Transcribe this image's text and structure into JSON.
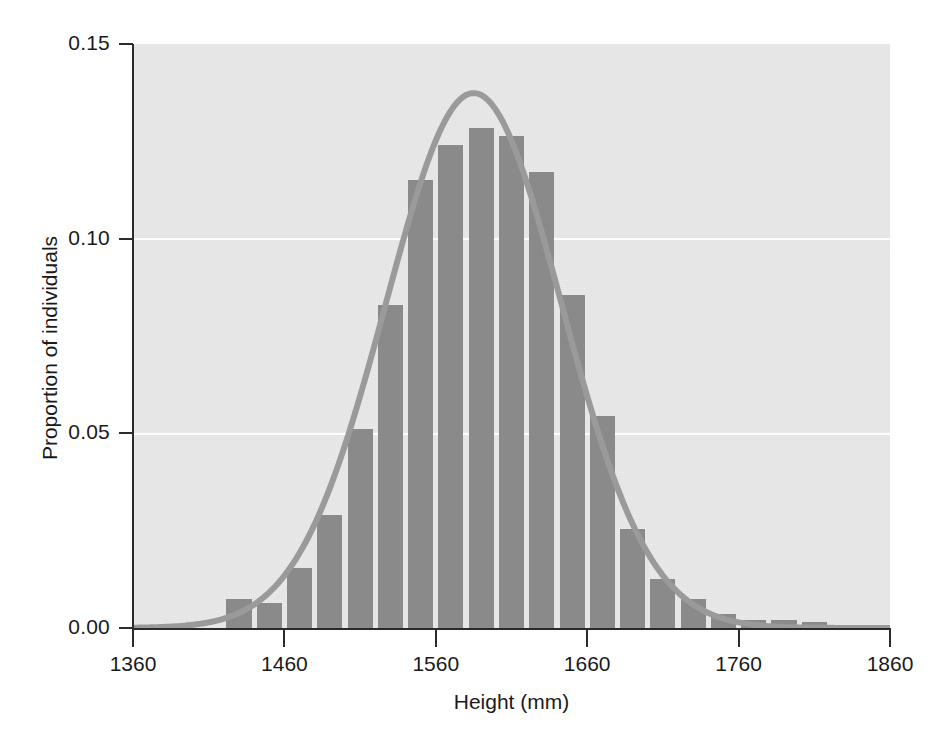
{
  "figure": {
    "background_color": "#ffffff",
    "plot_background_color": "#e9e9e9",
    "bar_color": "#8a8a8a",
    "curve_color": "#9a9a9a",
    "axis_color": "#2b2b2b",
    "gridline_color": "#ffffff"
  },
  "chart_data": {
    "type": "bar",
    "title": "",
    "subtitle": "",
    "xlabel": "Height (mm)",
    "ylabel": "Proportion of individuals",
    "xlim": [
      1360,
      1860
    ],
    "ylim": [
      0.0,
      0.15
    ],
    "xticks": [
      1360,
      1460,
      1560,
      1660,
      1760,
      1860
    ],
    "xticklabels": [
      "1360",
      "1460",
      "1560",
      "1660",
      "1760",
      "1860"
    ],
    "yticks": [
      0.0,
      0.05,
      0.1,
      0.15
    ],
    "yticklabels": [
      "0.00",
      "0.05",
      "0.10",
      "0.15"
    ],
    "grid": "horizontal-white-at-0.05-0.10",
    "legend": "none",
    "bin_width": 20,
    "bin_centers": [
      1430,
      1450,
      1470,
      1490,
      1510,
      1530,
      1550,
      1570,
      1590,
      1610,
      1630,
      1650,
      1670,
      1690,
      1710,
      1730,
      1750,
      1770,
      1790,
      1810
    ],
    "categories": [
      "1420-1440",
      "1440-1460",
      "1460-1480",
      "1480-1500",
      "1500-1520",
      "1520-1540",
      "1540-1560",
      "1560-1580",
      "1580-1600",
      "1600-1620",
      "1620-1640",
      "1640-1660",
      "1660-1680",
      "1680-1700",
      "1700-1720",
      "1720-1740",
      "1740-1760",
      "1760-1780",
      "1780-1800",
      "1800-1820"
    ],
    "values": [
      0.0075,
      0.0065,
      0.0155,
      0.029,
      0.051,
      0.083,
      0.115,
      0.124,
      0.1285,
      0.1265,
      0.117,
      0.0855,
      0.0545,
      0.0255,
      0.0125,
      0.0075,
      0.0035,
      0.002,
      0.002,
      0.0015
    ],
    "overlay_curve": {
      "type": "line",
      "label": "normal-distribution-fit",
      "mean": 1585,
      "sigma": 58,
      "peak_value": 0.1374,
      "color": "#9a9a9a"
    },
    "annotations": []
  }
}
